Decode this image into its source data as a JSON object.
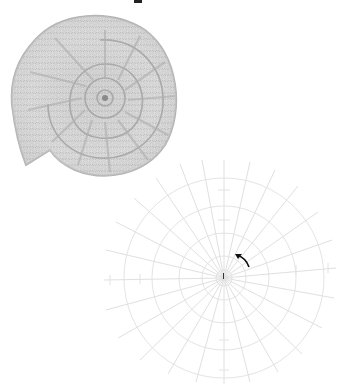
{
  "figure": {
    "title_fragment": "",
    "photo": {
      "subject": "crocheted spiral shell (ammonite) motif",
      "yarn_color": "#cfcfcf",
      "shadow_color": "#9a9a9a"
    },
    "chart": {
      "type": "radial crochet stitch chart",
      "line_color": "#e2e2e2",
      "spoke_count": 28,
      "center": {
        "x": 124,
        "y": 128
      },
      "arrow": {
        "direction": "up-left",
        "meaning": "direction of work",
        "color": "#111111"
      },
      "start_marker": "starting point tick"
    }
  }
}
